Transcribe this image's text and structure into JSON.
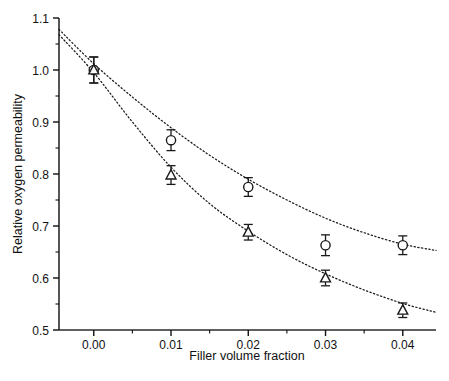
{
  "chart_data": {
    "type": "scatter",
    "title": "",
    "xlabel": "Filler volume fraction",
    "ylabel": "Relative oxygen permeability",
    "xlim": [
      -0.0045,
      0.0443
    ],
    "ylim": [
      0.5,
      1.1
    ],
    "xticks": [
      0.0,
      0.01,
      0.02,
      0.03,
      0.04
    ],
    "xticklabels": [
      "0.00",
      "0.01",
      "0.02",
      "0.03",
      "0.04"
    ],
    "x_minor_ticks": [
      0.005,
      0.015,
      0.025,
      0.035
    ],
    "yticks": [
      0.5,
      0.6,
      0.7,
      0.8,
      0.9,
      1.0,
      1.1
    ],
    "yticklabels": [
      "0.5",
      "0.6",
      "0.7",
      "0.8",
      "0.9",
      "1.0",
      "1.1"
    ],
    "y_minor_ticks": [
      0.55,
      0.65,
      0.75,
      0.85,
      0.95,
      1.05
    ],
    "grid": false,
    "legend": "none",
    "series": [
      {
        "name": "circle-series",
        "marker": "open-circle",
        "linestyle": "dotted",
        "color": "#1a1a1a",
        "x": [
          0.0,
          0.01,
          0.02,
          0.03,
          0.04
        ],
        "values": [
          1.0,
          0.865,
          0.775,
          0.663,
          0.663
        ],
        "yerr": [
          0.025,
          0.02,
          0.018,
          0.02,
          0.018
        ],
        "fit_curve": [
          [
            -0.0045,
            1.078
          ],
          [
            0.0,
            1.012
          ],
          [
            0.005,
            0.948
          ],
          [
            0.01,
            0.889
          ],
          [
            0.015,
            0.836
          ],
          [
            0.02,
            0.79
          ],
          [
            0.025,
            0.75
          ],
          [
            0.03,
            0.715
          ],
          [
            0.035,
            0.687
          ],
          [
            0.04,
            0.665
          ],
          [
            0.0443,
            0.653
          ]
        ]
      },
      {
        "name": "triangle-series",
        "marker": "open-triangle",
        "linestyle": "dotted",
        "color": "#1a1a1a",
        "x": [
          0.0,
          0.01,
          0.02,
          0.03,
          0.04
        ],
        "values": [
          1.0,
          0.798,
          0.688,
          0.6,
          0.538
        ],
        "yerr": [
          0.025,
          0.018,
          0.015,
          0.015,
          0.014
        ],
        "fit_curve": [
          [
            -0.0045,
            1.068
          ],
          [
            0.0,
            0.995
          ],
          [
            0.005,
            0.9
          ],
          [
            0.01,
            0.813
          ],
          [
            0.015,
            0.743
          ],
          [
            0.02,
            0.69
          ],
          [
            0.025,
            0.645
          ],
          [
            0.03,
            0.608
          ],
          [
            0.035,
            0.577
          ],
          [
            0.04,
            0.551
          ],
          [
            0.0443,
            0.534
          ]
        ]
      }
    ]
  },
  "axes": {
    "x_title": "Filler volume fraction",
    "y_title": "Relative oxygen permeability",
    "tick_color": "#111111",
    "axis_color": "#2b2b2b"
  }
}
